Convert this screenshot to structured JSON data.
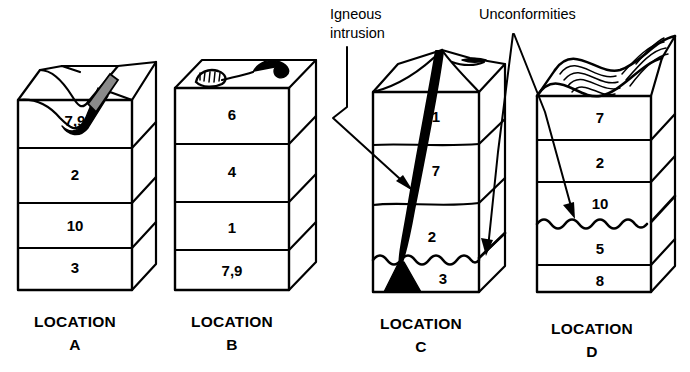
{
  "figure": {
    "type": "geologic-block-diagram",
    "background_color": "#ffffff",
    "line_color": "#000000"
  },
  "annotations": [
    {
      "id": "igneous",
      "name": "igneous-intrusion-label",
      "line1": "Igneous",
      "line2": "intrusion",
      "x": 330,
      "y": 14,
      "points_to": "location-c-dike"
    },
    {
      "id": "unconformities",
      "name": "unconformities-label",
      "text": "Unconformities",
      "x": 481,
      "y": 14,
      "points_to": "location-c-unconformity and location-d-unconformity"
    }
  ],
  "locations": [
    {
      "id": "A",
      "label_line1": "LOCATION",
      "label_line2": "A",
      "label_x": 75,
      "label_y": 327,
      "top_feature": "eroded-valley-with-dark-fill",
      "bottom_feature": "none",
      "layers": [
        {
          "name": "7,9",
          "cx": 75,
          "cy": 122
        },
        {
          "name": "2",
          "cx": 75,
          "cy": 175
        },
        {
          "name": "10",
          "cx": 75,
          "cy": 227
        },
        {
          "name": "3",
          "cx": 75,
          "cy": 268
        }
      ]
    },
    {
      "id": "B",
      "label_line1": "LOCATION",
      "label_line2": "B",
      "label_x": 232,
      "label_y": 327,
      "top_feature": "fossil-on-surface",
      "bottom_feature": "none",
      "layers": [
        {
          "name": "6",
          "cx": 232,
          "cy": 115
        },
        {
          "name": "4",
          "cx": 232,
          "cy": 172
        },
        {
          "name": "1",
          "cx": 232,
          "cy": 229
        },
        {
          "name": "7,9",
          "cx": 232,
          "cy": 272
        }
      ]
    },
    {
      "id": "C",
      "label_line1": "LOCATION",
      "label_line2": "C",
      "label_x": 421,
      "label_y": 329,
      "top_feature": "ridge-with-dike-outcrop",
      "bottom_feature": "wavy-unconformity-above-layer-3",
      "layers": [
        {
          "name": "1",
          "cx": 434,
          "cy": 117
        },
        {
          "name": "7",
          "cx": 434,
          "cy": 170
        },
        {
          "name": "2",
          "cx": 431,
          "cy": 237
        },
        {
          "name": "3",
          "cx": 441,
          "cy": 278
        }
      ]
    },
    {
      "id": "D",
      "label_line1": "LOCATION",
      "label_line2": "D",
      "label_x": 592,
      "label_y": 334,
      "top_feature": "wavy-erosional-surface",
      "bottom_feature": "wavy-unconformity-between-10-and-5",
      "layers": [
        {
          "name": "7",
          "cx": 600,
          "cy": 117
        },
        {
          "name": "2",
          "cx": 600,
          "cy": 164
        },
        {
          "name": "10",
          "cx": 600,
          "cy": 203
        },
        {
          "name": "5",
          "cx": 600,
          "cy": 250
        },
        {
          "name": "8",
          "cx": 600,
          "cy": 281
        }
      ]
    }
  ]
}
